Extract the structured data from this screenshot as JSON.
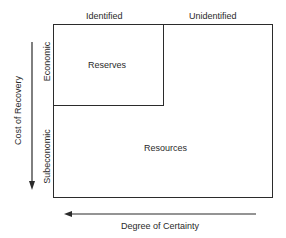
{
  "diagram": {
    "type": "mineral resource classification (McKelvey box)",
    "column_headers": {
      "identified": "Identified",
      "unidentified": "Unidentified"
    },
    "row_headers": {
      "economic": "Economic",
      "subeconomic": "Subeconomic"
    },
    "regions": {
      "reserves": "Reserves",
      "resources": "Resources"
    },
    "axes": {
      "vertical": {
        "label": "Cost of Recovery",
        "direction": "down"
      },
      "horizontal": {
        "label": "Degree of Certainty",
        "direction": "left"
      }
    },
    "colors": {
      "line": "#2b2b2b",
      "text": "#2a2a2a",
      "background": "#ffffff"
    }
  }
}
